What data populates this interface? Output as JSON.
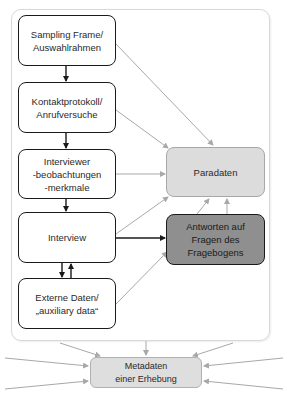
{
  "diagram": {
    "source_boxes": [
      {
        "id": "sampling",
        "lines": [
          "Sampling Frame/",
          "Auswahlrahmen"
        ]
      },
      {
        "id": "kontakt",
        "lines": [
          "Kontaktprotokoll/",
          "Anrufversuche"
        ]
      },
      {
        "id": "interviewer",
        "lines": [
          "Interviewer",
          "-beobachtungen",
          "-merkmale"
        ]
      },
      {
        "id": "interview",
        "lines": [
          "Interview"
        ]
      },
      {
        "id": "extern",
        "lines": [
          "Externe Daten/",
          "„auxiliary data“"
        ]
      }
    ],
    "paradaten": {
      "label": "Paradaten",
      "fill": "#dcdcdc"
    },
    "antworten": {
      "lines": [
        "Antworten auf",
        "Fragen des",
        "Fragebogens"
      ],
      "fill": "#8f8f8f"
    },
    "metadaten": {
      "lines": [
        "Metadaten",
        "einer Erhebung"
      ],
      "fill": "#dedede"
    },
    "colors": {
      "strong_arrow": "#1a1a1a",
      "light_arrow": "#a8a8a8",
      "container_border": "#d8d8d8"
    },
    "edges": [
      {
        "from": "sampling",
        "to": "kontakt",
        "style": "strong"
      },
      {
        "from": "kontakt",
        "to": "interviewer",
        "style": "strong"
      },
      {
        "from": "interviewer",
        "to": "interview",
        "style": "strong"
      },
      {
        "from": "interview",
        "to": "extern",
        "style": "strong"
      },
      {
        "from": "extern",
        "to": "interview",
        "style": "strong"
      },
      {
        "from": "interview",
        "to": "antworten",
        "style": "strong"
      },
      {
        "from": "sampling",
        "to": "paradaten",
        "style": "light"
      },
      {
        "from": "kontakt",
        "to": "paradaten",
        "style": "light"
      },
      {
        "from": "interviewer",
        "to": "paradaten",
        "style": "light"
      },
      {
        "from": "interview",
        "to": "paradaten",
        "style": "light"
      },
      {
        "from": "extern",
        "to": "antworten",
        "style": "light"
      },
      {
        "from": "antworten",
        "to": "paradaten",
        "style": "light"
      },
      {
        "from": "container",
        "to": "metadaten",
        "style": "light"
      },
      {
        "from": "external-left",
        "to": "metadaten",
        "style": "light"
      },
      {
        "from": "external-right",
        "to": "metadaten",
        "style": "light"
      }
    ]
  }
}
